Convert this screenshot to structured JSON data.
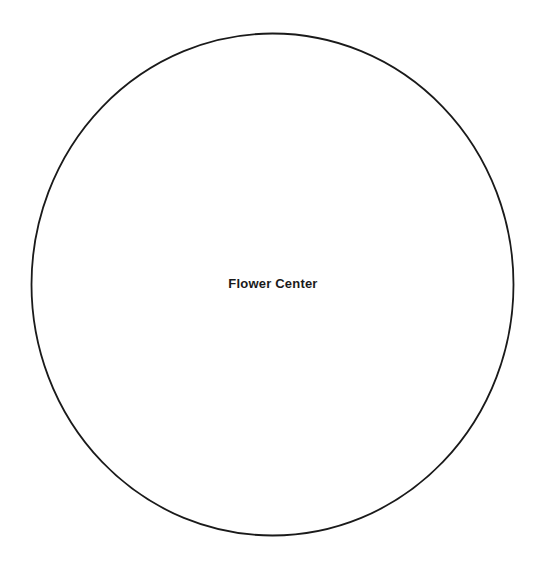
{
  "canvas": {
    "width": 546,
    "height": 564,
    "background_color": "#ffffff"
  },
  "diagram": {
    "title_visible": false,
    "shapes": [
      {
        "id": "flower-center",
        "kind": "ellipse",
        "label": "Flower Center",
        "label_color": "#1a1a1a",
        "stroke_color": "#1a1a1a",
        "stroke_width": 1.8,
        "fill": "none",
        "center_x": 272.5,
        "center_y": 284.5,
        "radius_x": 241,
        "radius_y": 251
      }
    ]
  }
}
